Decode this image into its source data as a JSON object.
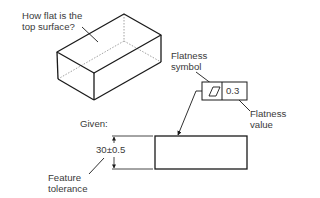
{
  "question_label": {
    "line1": "How flat is the",
    "line2": "top surface?"
  },
  "given_label": "Given:",
  "flatness_symbol_label": {
    "line1": "Flatness",
    "line2": "symbol"
  },
  "flatness_value_label": {
    "line1": "Flatness",
    "line2": "value"
  },
  "feature_control_frame": {
    "symbol": "flatness-parallelogram",
    "tolerance_value": "0.3"
  },
  "dimension": {
    "text": "30±0.5"
  },
  "feature_tolerance_label": {
    "line1": "Feature",
    "line2": "tolerance"
  },
  "colors": {
    "line": "#1a1a1a",
    "hidden_line": "#888888",
    "text": "#3a3a3a"
  }
}
